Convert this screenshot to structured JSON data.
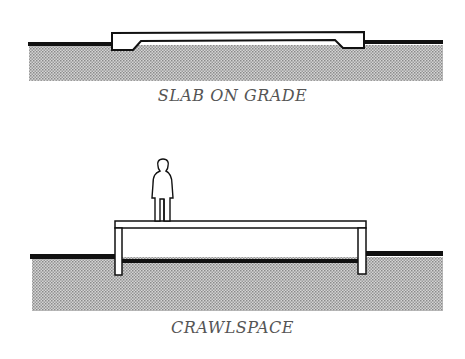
{
  "diagrams": [
    {
      "id": "slab",
      "caption": "SLAB ON GRADE",
      "elements": [
        "ground",
        "soil-hatch",
        "concrete-slab"
      ]
    },
    {
      "id": "crawlspace",
      "caption": "CRAWLSPACE",
      "elements": [
        "ground",
        "soil-hatch",
        "raised-floor",
        "foundation-posts",
        "human-figure"
      ]
    }
  ],
  "colors": {
    "ink": "#111111",
    "soil": "#b9b9b9",
    "caption": "#555555"
  }
}
